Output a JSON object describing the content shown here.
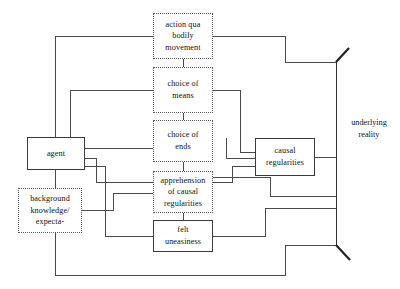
{
  "diagram": {
    "background_color": "#ffffff",
    "line_color": "#4a4a4a",
    "text_color": "#111111",
    "nodes": [
      {
        "id": "action",
        "label": "action qua\nbodily\nmovement",
        "border": "dotted",
        "x": 153,
        "y": 13,
        "w": 60,
        "h": 46
      },
      {
        "id": "means",
        "label": "choice of\nmeans",
        "border": "dotted",
        "x": 153,
        "y": 67,
        "w": 60,
        "h": 46
      },
      {
        "id": "ends",
        "label": "choice of\nends",
        "border": "dotted",
        "x": 153,
        "y": 120,
        "w": 60,
        "h": 42
      },
      {
        "id": "apprehension",
        "label": "apprehension\nof causal\nregularities",
        "border": "dotted",
        "x": 153,
        "y": 171,
        "w": 60,
        "h": 42
      },
      {
        "id": "felt",
        "label": "felt\nuneasiness",
        "border": "solid",
        "x": 153,
        "y": 220,
        "w": 60,
        "h": 32
      },
      {
        "id": "agent",
        "label": "agent",
        "border": "solid",
        "x": 27,
        "y": 137,
        "w": 58,
        "h": 33
      },
      {
        "id": "background",
        "label": "background\nknowledge/\nexpecta-",
        "border": "dotted",
        "x": 18,
        "y": 188,
        "w": 64,
        "h": 45
      },
      {
        "id": "causal",
        "label": "causal\nregularities",
        "border": "solid",
        "x": 255,
        "y": 138,
        "w": 60,
        "h": 38
      }
    ],
    "free_labels": [
      {
        "id": "underlying-reality",
        "label": "underlying\nreality",
        "x": 340,
        "y": 117,
        "w": 58
      }
    ],
    "bracket": {
      "id": "underlying-reality-bracket",
      "top_tip": [
        349,
        48
      ],
      "top_corner": [
        336,
        62
      ],
      "bottom_corner": [
        336,
        245
      ],
      "bottom_tip": [
        350,
        260
      ]
    }
  }
}
